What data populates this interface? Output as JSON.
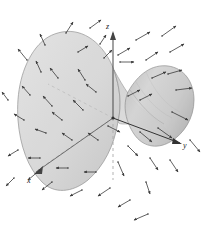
{
  "figure": {
    "type": "3d-surface-vector-field",
    "background_color": "#ffffff",
    "width": 210,
    "height": 229
  },
  "axes": {
    "labels": {
      "x": "x",
      "y": "y",
      "z": "z"
    },
    "origin": {
      "x": 113,
      "y": 118
    },
    "z_axis": {
      "label": "z",
      "label_x": 108,
      "label_y": 27,
      "tip_x": 113,
      "tip_y": 32,
      "style": "solid",
      "color": "#555555"
    },
    "y_axis": {
      "label": "y",
      "label_x": 184,
      "label_y": 146,
      "tip_x": 180,
      "tip_y": 142,
      "style": "solid",
      "color": "#333333"
    },
    "x_axis": {
      "label": "x",
      "label_x": 29,
      "label_y": 180,
      "tip_x": 36,
      "tip_y": 172,
      "style": "dashed",
      "color": "#999999"
    },
    "z_hidden": {
      "style": "dashed",
      "color": "#aaaaaa",
      "from_y": 118,
      "to_y": 178
    }
  },
  "surface": {
    "fill_left": "#d6d6d6",
    "fill_right": "#cfcfcf",
    "stroke": "#8a8a8a",
    "opacity": 0.92,
    "description": "hyperbolic paraboloid saddle: large left lobe rising toward viewer, right lobe curling up and away"
  },
  "arrows": {
    "color": "#3a3a3a",
    "head_color": "#3a3a3a",
    "count": 52,
    "stroke_width": 0.8,
    "semantic": "outward-pointing normal vector field",
    "items": [
      {
        "x1": 66,
        "y1": 33,
        "x2": 73,
        "y2": 22
      },
      {
        "x1": 90,
        "y1": 28,
        "x2": 101,
        "y2": 20
      },
      {
        "x1": 45,
        "y1": 45,
        "x2": 40,
        "y2": 34
      },
      {
        "x1": 27,
        "y1": 60,
        "x2": 18,
        "y2": 49
      },
      {
        "x1": 41,
        "y1": 72,
        "x2": 36,
        "y2": 61
      },
      {
        "x1": 78,
        "y1": 52,
        "x2": 88,
        "y2": 46
      },
      {
        "x1": 58,
        "y1": 78,
        "x2": 50,
        "y2": 68
      },
      {
        "x1": 85,
        "y1": 80,
        "x2": 78,
        "y2": 69
      },
      {
        "x1": 30,
        "y1": 95,
        "x2": 22,
        "y2": 86
      },
      {
        "x1": 52,
        "y1": 106,
        "x2": 43,
        "y2": 96
      },
      {
        "x1": 83,
        "y1": 110,
        "x2": 73,
        "y2": 100
      },
      {
        "x1": 24,
        "y1": 120,
        "x2": 14,
        "y2": 114
      },
      {
        "x1": 46,
        "y1": 133,
        "x2": 35,
        "y2": 129
      },
      {
        "x1": 72,
        "y1": 140,
        "x2": 62,
        "y2": 133
      },
      {
        "x1": 98,
        "y1": 140,
        "x2": 88,
        "y2": 133
      },
      {
        "x1": 40,
        "y1": 158,
        "x2": 28,
        "y2": 158
      },
      {
        "x1": 68,
        "y1": 168,
        "x2": 56,
        "y2": 168
      },
      {
        "x1": 96,
        "y1": 172,
        "x2": 84,
        "y2": 172
      },
      {
        "x1": 52,
        "y1": 182,
        "x2": 42,
        "y2": 190
      },
      {
        "x1": 82,
        "y1": 190,
        "x2": 70,
        "y2": 196
      },
      {
        "x1": 110,
        "y1": 188,
        "x2": 98,
        "y2": 196
      },
      {
        "x1": 130,
        "y1": 200,
        "x2": 118,
        "y2": 207
      },
      {
        "x1": 148,
        "y1": 214,
        "x2": 134,
        "y2": 220
      },
      {
        "x1": 18,
        "y1": 150,
        "x2": 8,
        "y2": 156
      },
      {
        "x1": 14,
        "y1": 178,
        "x2": 6,
        "y2": 186
      },
      {
        "x1": 40,
        "y1": 170,
        "x2": 28,
        "y2": 180
      },
      {
        "x1": 118,
        "y1": 55,
        "x2": 130,
        "y2": 48
      },
      {
        "x1": 136,
        "y1": 40,
        "x2": 150,
        "y2": 32
      },
      {
        "x1": 120,
        "y1": 62,
        "x2": 134,
        "y2": 62
      },
      {
        "x1": 146,
        "y1": 60,
        "x2": 158,
        "y2": 52
      },
      {
        "x1": 162,
        "y1": 36,
        "x2": 176,
        "y2": 26
      },
      {
        "x1": 170,
        "y1": 52,
        "x2": 184,
        "y2": 44
      },
      {
        "x1": 152,
        "y1": 78,
        "x2": 166,
        "y2": 72
      },
      {
        "x1": 128,
        "y1": 96,
        "x2": 140,
        "y2": 90
      },
      {
        "x1": 140,
        "y1": 100,
        "x2": 152,
        "y2": 94
      },
      {
        "x1": 168,
        "y1": 74,
        "x2": 182,
        "y2": 70
      },
      {
        "x1": 176,
        "y1": 90,
        "x2": 192,
        "y2": 88
      },
      {
        "x1": 172,
        "y1": 112,
        "x2": 188,
        "y2": 120
      },
      {
        "x1": 158,
        "y1": 128,
        "x2": 172,
        "y2": 138
      },
      {
        "x1": 140,
        "y1": 132,
        "x2": 152,
        "y2": 142
      },
      {
        "x1": 128,
        "y1": 146,
        "x2": 138,
        "y2": 156
      },
      {
        "x1": 150,
        "y1": 158,
        "x2": 158,
        "y2": 170
      },
      {
        "x1": 170,
        "y1": 160,
        "x2": 178,
        "y2": 172
      },
      {
        "x1": 190,
        "y1": 140,
        "x2": 200,
        "y2": 152
      },
      {
        "x1": 118,
        "y1": 162,
        "x2": 124,
        "y2": 176
      },
      {
        "x1": 146,
        "y1": 182,
        "x2": 150,
        "y2": 194
      },
      {
        "x1": 104,
        "y1": 58,
        "x2": 112,
        "y2": 50
      },
      {
        "x1": 100,
        "y1": 44,
        "x2": 106,
        "y2": 35
      },
      {
        "x1": 62,
        "y1": 120,
        "x2": 52,
        "y2": 112
      },
      {
        "x1": 96,
        "y1": 92,
        "x2": 86,
        "y2": 84
      },
      {
        "x1": 108,
        "y1": 126,
        "x2": 120,
        "y2": 132
      },
      {
        "x1": 8,
        "y1": 100,
        "x2": 2,
        "y2": 92
      }
    ]
  },
  "annotations": {
    "origin_dot": {
      "x": 113,
      "y": 118,
      "r": 1.6,
      "color": "#333333"
    }
  }
}
